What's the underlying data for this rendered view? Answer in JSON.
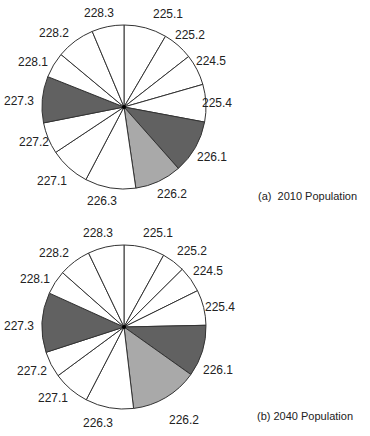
{
  "colors": {
    "white": "#ffffff",
    "dark": "#616161",
    "light": "#a9a9a9",
    "stroke": "#333333"
  },
  "chart_data": [
    {
      "type": "pie",
      "title": "(a)  2010 Population",
      "start_angle_deg": 0,
      "direction": "clockwise",
      "categories": [
        "225.1",
        "225.2",
        "224.5",
        "225.4",
        "226.1",
        "226.2",
        "226.3",
        "227.1",
        "227.2",
        "227.3",
        "228.1",
        "228.2",
        "228.3"
      ],
      "values_deg": [
        30.4,
        21.6,
        22.0,
        26.6,
        37.9,
        33.2,
        36.0,
        28.7,
        22.4,
        32.9,
        18.1,
        27.4,
        22.8
      ],
      "values_pct": [
        8.4,
        6.0,
        6.1,
        7.4,
        10.5,
        9.2,
        10.0,
        8.0,
        6.2,
        9.1,
        5.0,
        7.6,
        6.3
      ],
      "fills": [
        "white",
        "white",
        "white",
        "white",
        "dark",
        "light",
        "white",
        "white",
        "white",
        "dark",
        "white",
        "white",
        "white"
      ],
      "legend": "none (slices labeled directly)"
    },
    {
      "type": "pie",
      "title": "(b) 2040 Population",
      "start_angle_deg": 0,
      "direction": "clockwise",
      "categories": [
        "225.1",
        "225.2",
        "224.5",
        "225.4",
        "226.1",
        "226.2",
        "226.3",
        "227.1",
        "227.2",
        "227.3",
        "228.1",
        "228.2",
        "228.3"
      ],
      "values_deg": [
        28.9,
        16.4,
        18.4,
        25.1,
        36.6,
        47.9,
        34.1,
        26.2,
        18.4,
        42.4,
        17.1,
        22.9,
        25.6
      ],
      "values_pct": [
        8.0,
        4.6,
        5.1,
        7.0,
        10.2,
        13.3,
        9.5,
        7.3,
        5.1,
        11.8,
        4.8,
        6.4,
        7.1
      ],
      "fills": [
        "white",
        "white",
        "white",
        "white",
        "dark",
        "light",
        "white",
        "white",
        "white",
        "dark",
        "white",
        "white",
        "white"
      ],
      "legend": "none (slices labeled directly)"
    }
  ],
  "charts": [
    {
      "caption": "(a)  2010 Population",
      "labels": [
        {
          "text": "225.1",
          "x": 168,
          "y": 18
        },
        {
          "text": "225.2",
          "x": 190,
          "y": 39
        },
        {
          "text": "224.5",
          "x": 211,
          "y": 65
        },
        {
          "text": "225.4",
          "x": 217,
          "y": 107
        },
        {
          "text": "226.1",
          "x": 212,
          "y": 161
        },
        {
          "text": "226.2",
          "x": 172,
          "y": 198
        },
        {
          "text": "226.3",
          "x": 102,
          "y": 205
        },
        {
          "text": "227.1",
          "x": 52,
          "y": 185
        },
        {
          "text": "227.2",
          "x": 34,
          "y": 146
        },
        {
          "text": "227.3",
          "x": 19,
          "y": 105
        },
        {
          "text": "228.1",
          "x": 33,
          "y": 66
        },
        {
          "text": "228.2",
          "x": 54,
          "y": 37
        },
        {
          "text": "228.3",
          "x": 99,
          "y": 17
        }
      ]
    },
    {
      "caption": "(b) 2040 Population",
      "labels": [
        {
          "text": "225.1",
          "x": 158,
          "y": 237
        },
        {
          "text": "225.2",
          "x": 192,
          "y": 255
        },
        {
          "text": "224.5",
          "x": 208,
          "y": 275
        },
        {
          "text": "225.4",
          "x": 220,
          "y": 311
        },
        {
          "text": "226.1",
          "x": 218,
          "y": 374
        },
        {
          "text": "226.2",
          "x": 184,
          "y": 424
        },
        {
          "text": "226.3",
          "x": 98,
          "y": 427
        },
        {
          "text": "227.1",
          "x": 53,
          "y": 402
        },
        {
          "text": "227.2",
          "x": 32,
          "y": 375
        },
        {
          "text": "227.3",
          "x": 19,
          "y": 330
        },
        {
          "text": "228.1",
          "x": 35,
          "y": 283
        },
        {
          "text": "228.2",
          "x": 54,
          "y": 257
        },
        {
          "text": "228.3",
          "x": 98,
          "y": 237
        }
      ]
    }
  ],
  "geometry": [
    {
      "cx": 124,
      "cy": 107,
      "r": 82,
      "caption_x": 258,
      "caption_y": 196
    },
    {
      "cx": 124,
      "cy": 327,
      "r": 82,
      "caption_x": 257,
      "caption_y": 416
    }
  ]
}
